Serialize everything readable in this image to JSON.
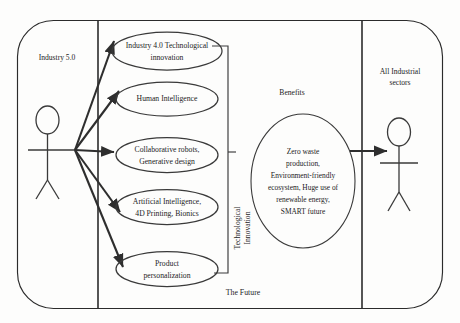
{
  "diagram": {
    "title_caption": "",
    "system_label_left": "Industry 5.0",
    "system_label_right_line1": "All Industrial",
    "system_label_right_line2": "sectors",
    "benefits_label": "Benefits",
    "future_label": "The Future",
    "bracket_label_line1": "Technological",
    "bracket_label_line2": "Innovation",
    "use_cases": [
      {
        "id": "industry-40",
        "line1": "Industry 4.0 Technological",
        "line2": "innovation",
        "cx": 167,
        "cy": 51,
        "rx": 55,
        "ry": 19
      },
      {
        "id": "human-intelligence",
        "line1": "Human Intelligence",
        "line2": "",
        "cx": 167,
        "cy": 99,
        "rx": 51,
        "ry": 17
      },
      {
        "id": "collaborative-robots",
        "line1": "Collaborative robots,",
        "line2": "Generative design",
        "cx": 167,
        "cy": 155,
        "rx": 51,
        "ry": 17.5
      },
      {
        "id": "artificial-intelligence",
        "line1": "Artificial Intelligence,",
        "line2": "4D Printing, Bionics",
        "cx": 167,
        "cy": 207,
        "rx": 51,
        "ry": 17.5
      },
      {
        "id": "product-personalization",
        "line1": "Product",
        "line2": "personalization",
        "cx": 167,
        "cy": 269,
        "rx": 51,
        "ry": 17.5
      }
    ],
    "benefits_lines": [
      "Zero waste",
      "production,",
      "Environment-friendly",
      "ecosystem, Huge use of",
      "renewable energy,",
      "SMART future"
    ],
    "actors": [
      {
        "id": "actor-industry-5",
        "name": "industry-5-actor",
        "x": 47,
        "y": 120
      },
      {
        "id": "actor-industrial-sectors",
        "name": "industrial-sectors-actor",
        "x": 399,
        "y": 132
      }
    ],
    "colors": {
      "stroke": "#2b2b2b",
      "text": "#1c1c1c",
      "background": "#fdfdfc",
      "ellipse_stroke": "#3a3a3a"
    }
  }
}
